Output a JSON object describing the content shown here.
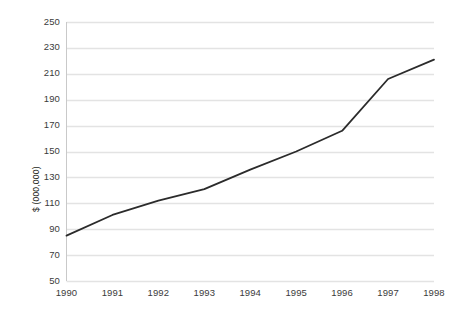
{
  "chart_data": {
    "type": "line",
    "title": "",
    "subtitle": "",
    "xlabel": "",
    "ylabel": "$ (000,000)",
    "categories": [
      "1990",
      "1991",
      "1992",
      "1993",
      "1994",
      "1995",
      "1996",
      "1997",
      "1998"
    ],
    "x": [
      1990,
      1991,
      1992,
      1993,
      1994,
      1995,
      1996,
      1997,
      1998
    ],
    "values": [
      85,
      101,
      112,
      121,
      136,
      150,
      166,
      206,
      221
    ],
    "series": [
      {
        "name": "",
        "values": [
          85,
          101,
          112,
          121,
          136,
          150,
          166,
          206,
          221
        ]
      }
    ],
    "ylim": [
      50,
      250
    ],
    "yticks": [
      50,
      70,
      90,
      110,
      130,
      150,
      170,
      190,
      210,
      230,
      250
    ],
    "ytick_labels": [
      "50",
      "70",
      "90",
      "110",
      "130",
      "150",
      "170",
      "190",
      "210",
      "230",
      "250"
    ],
    "xtick_labels": [
      "1990",
      "1991",
      "1992",
      "1993",
      "1994",
      "1995",
      "1996",
      "1997",
      "1998"
    ],
    "grid": true,
    "grid_axis": "y",
    "legend": false,
    "legend_position": "none",
    "line_color": "#2b2b2b",
    "grid_color": "#e3e3e3",
    "axis_color": "#bfbfbf",
    "background_color": "#ffffff",
    "markers": false,
    "annotations": []
  },
  "axis": {
    "y_title": "$ (000,000)"
  }
}
